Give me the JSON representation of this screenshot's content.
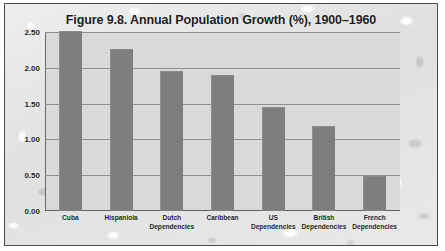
{
  "chart_data": {
    "type": "bar",
    "title": "Figure 9.8. Annual Population Growth (%), 1900–1960",
    "xlabel": "",
    "ylabel": "",
    "ylim": [
      0.0,
      2.5
    ],
    "ytick_step": 0.5,
    "ytick_labels": [
      "2.50",
      "2.00",
      "1.50",
      "1.00",
      "0.50",
      "0.00"
    ],
    "grid": true,
    "legend": "none",
    "categories": [
      "Cuba",
      "Hispaniola",
      "Dutch Dependencies",
      "Caribbean",
      "US Dependencies",
      "British Dependencies",
      "French Dependencies"
    ],
    "values": [
      2.5,
      2.25,
      1.94,
      1.88,
      1.44,
      1.18,
      0.48
    ],
    "bars": [
      {
        "label": "Cuba",
        "label_lines": [
          "Cuba"
        ],
        "value": 2.5
      },
      {
        "label": "Hispaniola",
        "label_lines": [
          "Hispaniola"
        ],
        "value": 2.25
      },
      {
        "label": "Dutch Dependencies",
        "label_lines": [
          "Dutch",
          "Dependencies"
        ],
        "value": 1.94
      },
      {
        "label": "Caribbean",
        "label_lines": [
          "Caribbean"
        ],
        "value": 1.88
      },
      {
        "label": "US Dependencies",
        "label_lines": [
          "US Dependencies"
        ],
        "value": 1.44
      },
      {
        "label": "British Dependencies",
        "label_lines": [
          "British",
          "Dependencies"
        ],
        "value": 1.18
      },
      {
        "label": "French Dependencies",
        "label_lines": [
          "French",
          "Dependencies"
        ],
        "value": 0.48
      }
    ],
    "colors": {
      "bar": "#7e7e7e",
      "plot_background": "#d9d9d9",
      "page_background": "#e6e6e6",
      "gridline": "#8e8e8e",
      "axis": "#5e5e5e",
      "text": "#1b1b1b",
      "frame_border": "#4a4a4a"
    }
  }
}
